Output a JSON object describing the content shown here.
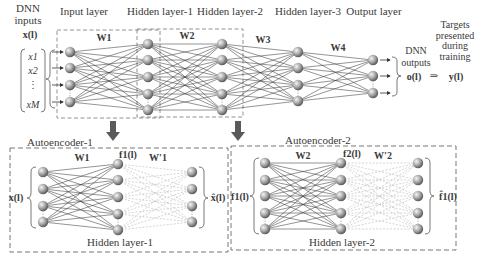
{
  "header": {
    "dnn_inputs_line1": "DNN",
    "dnn_inputs_line2": "inputs",
    "input_vector": "x(l)",
    "input_elements": [
      "x1",
      "x2",
      "⋮",
      "xM"
    ],
    "layer_titles": [
      "Input layer",
      "Hidden layer-1",
      "Hidden layer-2",
      "Hidden layer-3",
      "Output layer"
    ],
    "dnn_outputs_line1": "DNN",
    "dnn_outputs_line2": "outputs",
    "output_vector": "o(l)",
    "implies": "⇒",
    "targets_label": [
      "Targets",
      "presented",
      "during",
      "training"
    ],
    "target_vector": "y(l)"
  },
  "dnn": {
    "weights": [
      "W1",
      "W2",
      "W3",
      "W4"
    ],
    "layers": [
      {
        "name": "Input layer",
        "x": 70,
        "nodes": [
          52,
          68,
          85,
          102
        ]
      },
      {
        "name": "Hidden layer-1",
        "x": 148,
        "nodes": [
          44,
          60,
          77,
          94,
          110
        ]
      },
      {
        "name": "Hidden layer-2",
        "x": 222,
        "nodes": [
          44,
          60,
          77,
          94,
          110
        ]
      },
      {
        "name": "Hidden layer-3",
        "x": 298,
        "nodes": [
          52,
          68,
          85,
          101
        ]
      },
      {
        "name": "Output layer",
        "x": 373,
        "nodes": [
          60,
          76,
          93
        ]
      }
    ]
  },
  "autoencoder1": {
    "title": "Autoencoder-1",
    "input_vector": "x(l)",
    "hidden_vector": "f1(l)",
    "output_vector": "x̂(l)",
    "encoder_weight": "W1",
    "decoder_weight": "W'1",
    "hidden_label": "Hidden layer-1",
    "layers": [
      {
        "x": 43,
        "nodes": [
          172,
          189,
          206,
          222
        ]
      },
      {
        "x": 118,
        "nodes": [
          164,
          180,
          197,
          214,
          230
        ]
      },
      {
        "x": 192,
        "nodes": [
          172,
          189,
          206,
          222
        ]
      }
    ]
  },
  "autoencoder2": {
    "title": "Autoencoder-2",
    "input_vector": "f1(l)",
    "hidden_vector": "f2(l)",
    "output_vector": "f̂1(l)",
    "encoder_weight": "W2",
    "decoder_weight": "W'2",
    "hidden_label": "Hidden layer-2",
    "layers": [
      {
        "x": 265,
        "nodes": [
          163,
          180,
          196,
          213,
          229
        ]
      },
      {
        "x": 341,
        "nodes": [
          163,
          180,
          196,
          213,
          229
        ]
      },
      {
        "x": 418,
        "nodes": [
          163,
          180,
          196,
          213,
          229
        ]
      }
    ]
  },
  "colors": {
    "line": "#3c3c3c",
    "dashed_line": "#b8b8b8",
    "box_border": "#777777",
    "arrow": "#5a5a5a",
    "node_light": "#e8e8e8",
    "node_dark": "#6a6a6a"
  }
}
